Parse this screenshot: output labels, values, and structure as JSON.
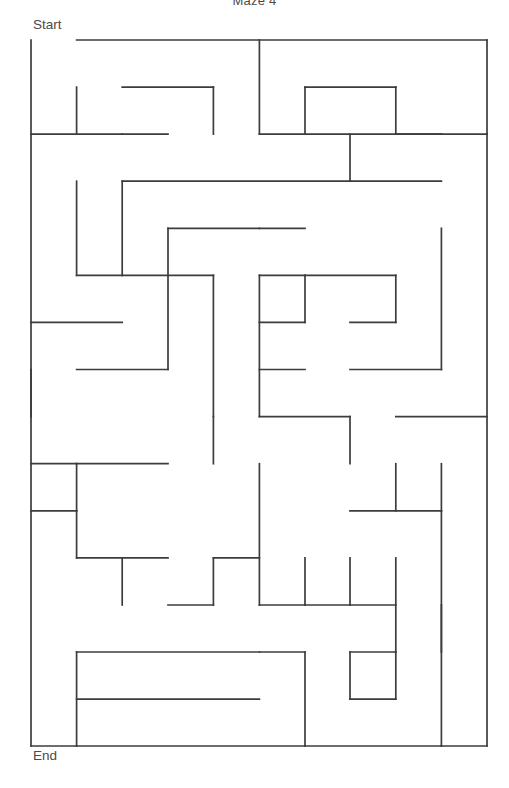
{
  "title": "Maze 4",
  "labels": {
    "start": "Start",
    "end": "End"
  },
  "maze": {
    "columns": 10,
    "rows": 15,
    "origin_x": 31,
    "origin_y": 40,
    "cell_width": 45.6,
    "cell_height": 47.07,
    "wall_color": "#3c3c3c",
    "wall_thickness": 1.7,
    "background_color": "#ffffff",
    "entrance": "top-left",
    "exit": "bottom-left",
    "segments": [
      [
        31,
        40,
        31,
        746
      ],
      [
        76.6,
        40,
        487,
        40
      ],
      [
        31,
        746,
        76.6,
        746
      ],
      [
        259.4,
        40,
        259.4,
        134.1
      ],
      [
        487,
        40,
        487,
        134.1
      ],
      [
        259.4,
        134.1,
        441.4,
        134.1
      ],
      [
        441.4,
        134.1,
        487,
        134.1
      ],
      [
        76.6,
        87.1,
        76.6,
        134.1
      ],
      [
        122.2,
        87.1,
        213.4,
        87.1
      ],
      [
        213.4,
        87.1,
        213.4,
        134.1
      ],
      [
        305,
        87.1,
        305,
        134.1
      ],
      [
        395.8,
        87.1,
        395.8,
        134.1
      ],
      [
        305,
        87.1,
        395.8,
        87.1
      ],
      [
        31,
        134.1,
        122.2,
        134.1
      ],
      [
        122.2,
        134.1,
        168,
        134.1
      ],
      [
        350,
        134.1,
        350,
        181.2
      ],
      [
        395.8,
        134.1,
        441.4,
        134.1
      ],
      [
        76.6,
        181.2,
        76.6,
        275.3
      ],
      [
        122.2,
        181.2,
        350,
        181.2
      ],
      [
        350,
        181.2,
        441.4,
        181.2
      ],
      [
        122.2,
        181.2,
        122.2,
        275.3
      ],
      [
        168,
        228.3,
        168,
        369.5
      ],
      [
        168,
        228.3,
        259.4,
        228.3
      ],
      [
        259.4,
        228.3,
        305,
        228.3
      ],
      [
        441.4,
        228.3,
        441.4,
        369.5
      ],
      [
        76.6,
        275.3,
        122.2,
        275.3
      ],
      [
        122.2,
        275.3,
        213.4,
        275.3
      ],
      [
        213.4,
        275.3,
        213.4,
        416.6
      ],
      [
        259.4,
        275.3,
        259.4,
        416.6
      ],
      [
        259.4,
        275.3,
        305,
        275.3
      ],
      [
        305,
        275.3,
        305,
        322.4
      ],
      [
        305,
        275.3,
        395.8,
        275.3
      ],
      [
        395.8,
        275.3,
        395.8,
        322.4
      ],
      [
        31,
        322.4,
        122.2,
        322.4
      ],
      [
        259.4,
        322.4,
        305,
        322.4
      ],
      [
        350,
        322.4,
        395.8,
        322.4
      ],
      [
        31,
        369.5,
        31,
        416.6
      ],
      [
        76.6,
        369.5,
        168,
        369.5
      ],
      [
        259.4,
        369.5,
        305,
        369.5
      ],
      [
        350,
        369.5,
        441.4,
        369.5
      ],
      [
        213.4,
        416.6,
        213.4,
        463.7
      ],
      [
        259.4,
        416.6,
        350,
        416.6
      ],
      [
        350,
        416.6,
        350,
        463.7
      ],
      [
        395.8,
        416.6,
        487,
        416.6
      ],
      [
        31,
        463.7,
        76.6,
        463.7
      ],
      [
        76.6,
        463.7,
        76.6,
        510.8
      ],
      [
        76.6,
        463.7,
        168,
        463.7
      ],
      [
        259.4,
        463.7,
        259.4,
        605
      ],
      [
        441.4,
        463.7,
        441.4,
        510.8
      ],
      [
        395.8,
        463.7,
        395.8,
        510.8
      ],
      [
        31,
        510.8,
        76.6,
        510.8
      ],
      [
        76.6,
        510.8,
        76.6,
        557.9
      ],
      [
        76.6,
        557.9,
        168,
        557.9
      ],
      [
        122.2,
        557.9,
        122.2,
        605
      ],
      [
        350,
        510.8,
        441.4,
        510.8
      ],
      [
        441.4,
        510.8,
        441.4,
        746
      ],
      [
        213.4,
        557.9,
        213.4,
        605
      ],
      [
        213.4,
        557.9,
        259.4,
        557.9
      ],
      [
        305,
        557.9,
        305,
        605
      ],
      [
        395.8,
        557.9,
        395.8,
        652
      ],
      [
        350,
        557.9,
        350,
        605
      ],
      [
        259.4,
        605,
        305,
        605
      ],
      [
        305,
        605,
        350,
        605
      ],
      [
        168,
        605,
        213.4,
        605
      ],
      [
        350,
        605,
        395.8,
        605
      ],
      [
        441.4,
        605,
        441.4,
        652
      ],
      [
        76.6,
        652,
        259.4,
        652
      ],
      [
        259.4,
        652,
        305,
        652
      ],
      [
        305,
        652,
        305,
        746
      ],
      [
        76.6,
        652,
        76.6,
        746
      ],
      [
        350,
        652,
        395.8,
        652
      ],
      [
        350,
        652,
        350,
        699.1
      ],
      [
        395.8,
        652,
        395.8,
        699.1
      ],
      [
        76.6,
        699.1,
        259.4,
        699.1
      ],
      [
        350,
        699.1,
        395.8,
        699.1
      ],
      [
        76.6,
        746,
        305,
        746
      ],
      [
        305,
        746,
        441.4,
        746
      ],
      [
        441.4,
        746,
        487,
        746
      ],
      [
        487,
        134.1,
        487,
        746
      ]
    ]
  }
}
